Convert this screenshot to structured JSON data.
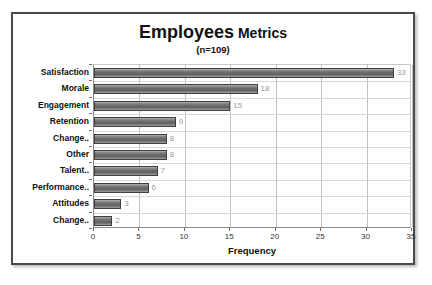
{
  "chart_data": {
    "type": "bar",
    "orientation": "horizontal",
    "title_main": "Employees",
    "title_rest": "Metrics",
    "subtitle": "(n=109)",
    "xlabel": "Frequency",
    "ylabel": "",
    "xlim": [
      0,
      35
    ],
    "xticks": [
      0,
      5,
      10,
      15,
      20,
      25,
      30,
      35
    ],
    "xtick_labels": [
      "0",
      "5",
      "10",
      "15",
      "20",
      "25",
      "30",
      "35"
    ],
    "grid": true,
    "legend": false,
    "categories": [
      "Satisfaction",
      "Morale",
      "Engagement",
      "Retention",
      "Change..",
      "Other",
      "Talent..",
      "Performance..",
      "Attitudes",
      "Change.."
    ],
    "values": [
      33,
      18,
      15,
      9,
      8,
      8,
      7,
      6,
      3,
      2
    ],
    "data_labels": [
      "33",
      "18",
      "15",
      "9",
      "8",
      "8",
      "7",
      "6",
      "3",
      "2"
    ],
    "colors": {
      "bar_fill_dark": "#5f5f5f",
      "bar_fill_light": "#b9b9b9",
      "bar_border": "#3f3f3f",
      "data_label": "#9a9a9a",
      "grid": "#c0c0c0",
      "axis": "#6d6d6d",
      "text": "#111111",
      "frame_border": "#4a4a4a",
      "background": "#ffffff"
    }
  }
}
